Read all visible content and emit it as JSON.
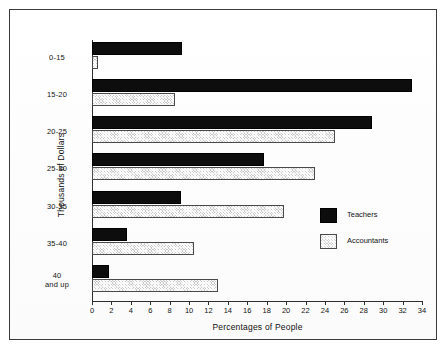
{
  "chart_data": {
    "type": "bar",
    "orientation": "horizontal",
    "title": "",
    "xlabel": "Percentages of People",
    "ylabel": "Thousands of Dollars",
    "categories": [
      "0-15",
      "15-20",
      "20-25",
      "25-30",
      "30-35",
      "35-40",
      "40\nand up"
    ],
    "category_labels": [
      {
        "line1": "0-15",
        "line2": ""
      },
      {
        "line1": "15-20",
        "line2": ""
      },
      {
        "line1": "20-25",
        "line2": ""
      },
      {
        "line1": "25-30",
        "line2": ""
      },
      {
        "line1": "30-35",
        "line2": ""
      },
      {
        "line1": "35-40",
        "line2": ""
      },
      {
        "line1": "40",
        "line2": "and up"
      }
    ],
    "series": [
      {
        "name": "Teachers",
        "fill": "solid-black",
        "color": "#0d0d0d",
        "values": [
          9.3,
          33.0,
          28.8,
          17.7,
          9.2,
          3.6,
          1.7
        ]
      },
      {
        "name": "Accountants",
        "fill": "gray-crosshatch",
        "color": "#c9c9c9",
        "values": [
          0.6,
          8.5,
          25.0,
          23.0,
          19.8,
          10.5,
          13.0
        ]
      }
    ],
    "xlim": [
      0,
      34
    ],
    "xticks": [
      0,
      2,
      4,
      6,
      8,
      10,
      12,
      14,
      16,
      18,
      20,
      22,
      24,
      26,
      28,
      30,
      32,
      34
    ],
    "xtick_labels": [
      "0",
      "2",
      "4",
      "6",
      "8",
      "10",
      "12",
      "14",
      "16",
      "18",
      "20",
      "22",
      "24",
      "26",
      "28",
      "30",
      "32",
      "34"
    ],
    "grid": false,
    "legend_position": "center-right",
    "legend_entries": [
      "Teachers",
      "Accountants"
    ],
    "frame": true
  }
}
